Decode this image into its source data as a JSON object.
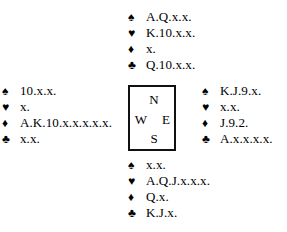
{
  "diagram": {
    "type": "bridge-deal",
    "suit_symbols": {
      "spades": "♠",
      "hearts": "♥",
      "diamonds": "♦",
      "clubs": "♣"
    },
    "compass": {
      "north": "N",
      "west": "W",
      "east": "E",
      "south": "S"
    },
    "hands": {
      "north": {
        "spades": "A.Q.x.x.",
        "hearts": "K.10.x.x.",
        "diamonds": "x.",
        "clubs": "Q.10.x.x."
      },
      "west": {
        "spades": "10.x.x.",
        "hearts": "x.",
        "diamonds": "A.K.10.x.x.x.x.x.",
        "clubs": "x.x."
      },
      "east": {
        "spades": "K.J.9.x.",
        "hearts": "x.x.",
        "diamonds": "J.9.2.",
        "clubs": "A.x.x.x.x."
      },
      "south": {
        "spades": "x.x.",
        "hearts": "A.Q.J.x.x.x.",
        "diamonds": "Q.x.",
        "clubs": "K.J.x."
      }
    }
  }
}
